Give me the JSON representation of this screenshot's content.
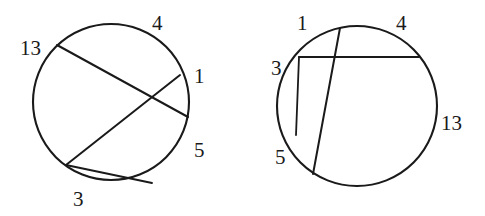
{
  "figure": {
    "background_color": "#ffffff",
    "stroke_color": "#1a1a1a",
    "panels": [
      {
        "id": "left-circle",
        "name": "left-circle-figure",
        "circle": {
          "cx": 111,
          "cy": 102,
          "r": 78
        },
        "chords": [
          {
            "name": "chord-13-1",
            "x1": 57,
            "y1": 45,
            "x2": 188,
            "y2": 117
          },
          {
            "name": "chord-4-3",
            "x1": 180,
            "y1": 75,
            "x2": 66,
            "y2": 165
          },
          {
            "name": "chord-3-5",
            "x1": 66,
            "y1": 165,
            "x2": 152,
            "y2": 183
          }
        ],
        "labels": [
          {
            "name": "arc-label-4",
            "text": "4",
            "x": 152,
            "y": 13
          },
          {
            "name": "arc-label-13",
            "text": "13",
            "x": 20,
            "y": 38
          },
          {
            "name": "arc-label-1",
            "text": "1",
            "x": 194,
            "y": 66
          },
          {
            "name": "arc-label-5",
            "text": "5",
            "x": 194,
            "y": 140
          },
          {
            "name": "arc-label-3",
            "text": "3",
            "x": 73,
            "y": 189
          }
        ]
      },
      {
        "id": "right-circle",
        "name": "right-circle-figure",
        "circle": {
          "cx": 357,
          "cy": 106,
          "r": 80
        },
        "chords": [
          {
            "name": "chord-3-4",
            "x1": 299,
            "y1": 57,
            "x2": 419,
            "y2": 57
          },
          {
            "name": "chord-1-5",
            "x1": 340,
            "y1": 28,
            "x2": 313,
            "y2": 174
          },
          {
            "name": "chord-1b-5",
            "x1": 299,
            "y1": 57,
            "x2": 296,
            "y2": 135
          }
        ],
        "labels": [
          {
            "name": "arc-label-1",
            "text": "1",
            "x": 297,
            "y": 13
          },
          {
            "name": "arc-label-4",
            "text": "4",
            "x": 396,
            "y": 13
          },
          {
            "name": "arc-label-3",
            "text": "3",
            "x": 271,
            "y": 58
          },
          {
            "name": "arc-label-13",
            "text": "13",
            "x": 441,
            "y": 113
          },
          {
            "name": "arc-label-5",
            "text": "5",
            "x": 275,
            "y": 147
          }
        ]
      }
    ]
  }
}
